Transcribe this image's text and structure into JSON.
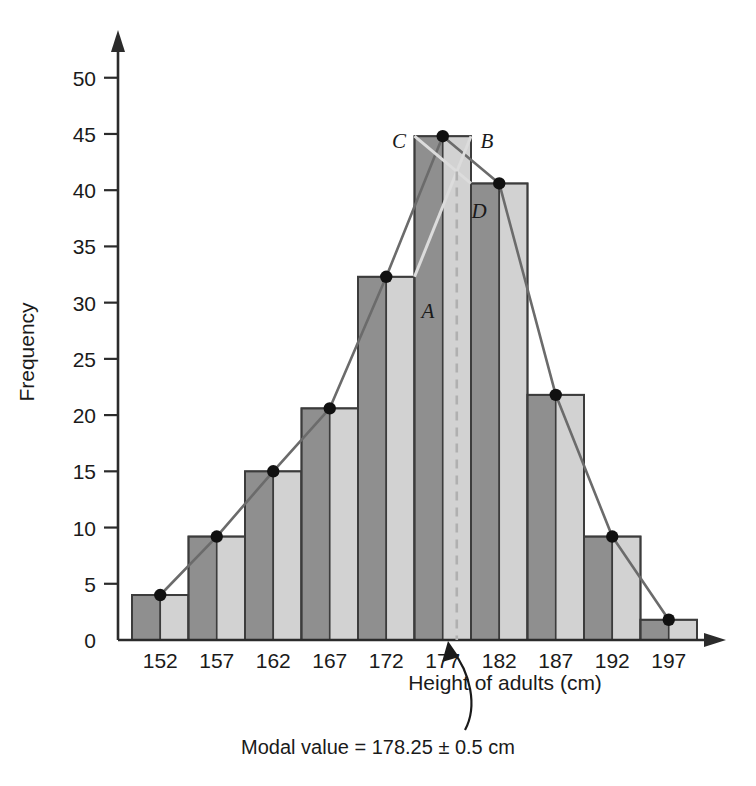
{
  "chart_data": {
    "type": "bar",
    "title": "",
    "subtitle": "",
    "xlabel": "Height of adults (cm)",
    "ylabel": "Frequency",
    "categories": [
      "152",
      "157",
      "162",
      "167",
      "172",
      "177",
      "182",
      "187",
      "192",
      "197"
    ],
    "values": [
      4,
      9.2,
      15,
      20.6,
      32.3,
      44.8,
      40.6,
      21.8,
      9.2,
      1.8
    ],
    "xlim": [
      149.5,
      199.5
    ],
    "ylim": [
      0,
      53
    ],
    "ytick_labels": [
      "0",
      "5",
      "10",
      "15",
      "20",
      "25",
      "30",
      "35",
      "40",
      "45",
      "50"
    ],
    "ytick_values": [
      0,
      5,
      10,
      15,
      20,
      25,
      30,
      35,
      40,
      45,
      50
    ],
    "xtick_labels": [
      "152",
      "157",
      "162",
      "167",
      "172",
      "177",
      "182",
      "187",
      "192",
      "197"
    ],
    "grid": false,
    "legend": "none",
    "series": [
      {
        "name": "Frequency polygon",
        "categories": [
          "152",
          "157",
          "162",
          "167",
          "172",
          "177",
          "182",
          "187",
          "192",
          "197"
        ],
        "values": [
          4,
          9.2,
          15,
          20.6,
          32.3,
          44.8,
          40.6,
          21.8,
          9.2,
          1.8
        ]
      }
    ],
    "annotations": [
      {
        "label": "A",
        "meaning": "top-right corner of pre-modal class bar"
      },
      {
        "label": "B",
        "meaning": "top-right corner of modal class bar"
      },
      {
        "label": "C",
        "meaning": "top-left corner of modal class bar"
      },
      {
        "label": "D",
        "meaning": "top-left corner of post-modal class bar"
      },
      {
        "label": "Modal value = 178.25 ± 0.5 cm",
        "meaning": "modal value callout"
      }
    ],
    "modal_value": 178.25,
    "modal_tolerance": 0.5
  },
  "axes": {
    "y_title": "Frequency",
    "x_title": "Height of adults (cm)"
  },
  "callout": {
    "text": "Modal value = 178.25 ± 0.5 cm"
  },
  "point_labels": {
    "a": "A",
    "b": "B",
    "c": "C",
    "d": "D"
  },
  "colors": {
    "bar_dark": "#8f8f8f",
    "bar_light": "#d2d2d2",
    "bar_outline": "#3c3c3c",
    "axis": "#2b2b2b",
    "polygon": "#6b6b6b",
    "dash": "#b0b0b0",
    "text": "#1a1a1a"
  }
}
